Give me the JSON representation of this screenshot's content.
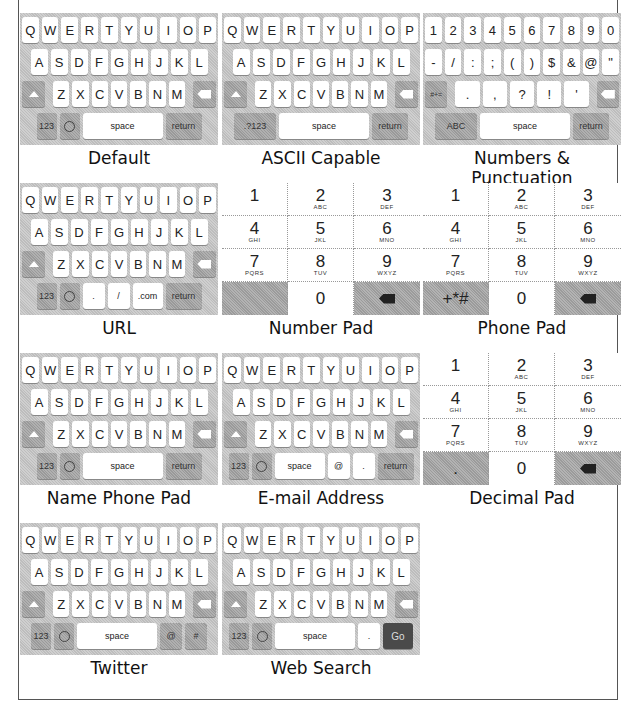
{
  "keyboards": [
    {
      "name": "Default",
      "rows": [
        [
          "Q",
          "W",
          "E",
          "R",
          "T",
          "Y",
          "U",
          "I",
          "O",
          "P"
        ],
        [
          "A",
          "S",
          "D",
          "F",
          "G",
          "H",
          "J",
          "K",
          "L"
        ],
        [
          "Z",
          "X",
          "C",
          "V",
          "B",
          "N",
          "M"
        ]
      ],
      "bottom": [
        "123",
        "emoji",
        "space",
        "return"
      ]
    },
    {
      "name": "ASCII Capable",
      "rows": [
        [
          "Q",
          "W",
          "E",
          "R",
          "T",
          "Y",
          "U",
          "I",
          "O",
          "P"
        ],
        [
          "A",
          "S",
          "D",
          "F",
          "G",
          "H",
          "J",
          "K",
          "L"
        ],
        [
          "Z",
          "X",
          "C",
          "V",
          "B",
          "N",
          "M"
        ]
      ],
      "bottom": [
        ".?123",
        "space",
        "return"
      ]
    },
    {
      "name": "Numbers & Punctuation",
      "rows": [
        [
          "1",
          "2",
          "3",
          "4",
          "5",
          "6",
          "7",
          "8",
          "9",
          "0"
        ],
        [
          "-",
          "/",
          ":",
          ";",
          "(",
          ")",
          "$",
          "&",
          "@",
          "\""
        ],
        [
          ".",
          ",",
          "?",
          "!",
          "'"
        ]
      ],
      "bottom": [
        "ABC",
        "space",
        "return"
      ],
      "left_mod": "#+="
    },
    {
      "name": "URL",
      "rows": [
        [
          "Q",
          "W",
          "E",
          "R",
          "T",
          "Y",
          "U",
          "I",
          "O",
          "P"
        ],
        [
          "A",
          "S",
          "D",
          "F",
          "G",
          "H",
          "J",
          "K",
          "L"
        ],
        [
          "Z",
          "X",
          "C",
          "V",
          "B",
          "N",
          "M"
        ]
      ],
      "bottom": [
        "123",
        "emoji",
        ".",
        "/",
        ".com",
        "return"
      ]
    },
    {
      "name": "Number Pad",
      "keys": [
        [
          "1",
          ""
        ],
        [
          "2",
          "ABC"
        ],
        [
          "3",
          "DEF"
        ],
        [
          "4",
          "GHI"
        ],
        [
          "5",
          "JKL"
        ],
        [
          "6",
          "MNO"
        ],
        [
          "7",
          "PQRS"
        ],
        [
          "8",
          "TUV"
        ],
        [
          "9",
          "WXYZ"
        ],
        [
          "",
          ""
        ],
        [
          "0",
          ""
        ],
        [
          "delete",
          ""
        ]
      ]
    },
    {
      "name": "Phone Pad",
      "keys": [
        [
          "1",
          ""
        ],
        [
          "2",
          "ABC"
        ],
        [
          "3",
          "DEF"
        ],
        [
          "4",
          "GHI"
        ],
        [
          "5",
          "JKL"
        ],
        [
          "6",
          "MNO"
        ],
        [
          "7",
          "PQRS"
        ],
        [
          "8",
          "TUV"
        ],
        [
          "9",
          "WXYZ"
        ],
        [
          "+*#",
          ""
        ],
        [
          "0",
          ""
        ],
        [
          "delete",
          ""
        ]
      ]
    },
    {
      "name": "Name Phone Pad",
      "rows": [
        [
          "Q",
          "W",
          "E",
          "R",
          "T",
          "Y",
          "U",
          "I",
          "O",
          "P"
        ],
        [
          "A",
          "S",
          "D",
          "F",
          "G",
          "H",
          "J",
          "K",
          "L"
        ],
        [
          "Z",
          "X",
          "C",
          "V",
          "B",
          "N",
          "M"
        ]
      ],
      "bottom": [
        "123",
        "emoji",
        "space",
        "return"
      ]
    },
    {
      "name": "E-mail Address",
      "rows": [
        [
          "Q",
          "W",
          "E",
          "R",
          "T",
          "Y",
          "U",
          "I",
          "O",
          "P"
        ],
        [
          "A",
          "S",
          "D",
          "F",
          "G",
          "H",
          "J",
          "K",
          "L"
        ],
        [
          "Z",
          "X",
          "C",
          "V",
          "B",
          "N",
          "M"
        ]
      ],
      "bottom": [
        "123",
        "emoji",
        "space",
        "@",
        ".",
        "return"
      ]
    },
    {
      "name": "Decimal Pad",
      "keys": [
        [
          "1",
          ""
        ],
        [
          "2",
          "ABC"
        ],
        [
          "3",
          "DEF"
        ],
        [
          "4",
          "GHI"
        ],
        [
          "5",
          "JKL"
        ],
        [
          "6",
          "MNO"
        ],
        [
          "7",
          "PQRS"
        ],
        [
          "8",
          "TUV"
        ],
        [
          "9",
          "WXYZ"
        ],
        [
          ".",
          ""
        ],
        [
          "0",
          ""
        ],
        [
          "delete",
          ""
        ]
      ]
    },
    {
      "name": "Twitter",
      "rows": [
        [
          "Q",
          "W",
          "E",
          "R",
          "T",
          "Y",
          "U",
          "I",
          "O",
          "P"
        ],
        [
          "A",
          "S",
          "D",
          "F",
          "G",
          "H",
          "J",
          "K",
          "L"
        ],
        [
          "Z",
          "X",
          "C",
          "V",
          "B",
          "N",
          "M"
        ]
      ],
      "bottom": [
        "123",
        "emoji",
        "space",
        "@",
        "#"
      ]
    },
    {
      "name": "Web Search",
      "rows": [
        [
          "Q",
          "W",
          "E",
          "R",
          "T",
          "Y",
          "U",
          "I",
          "O",
          "P"
        ],
        [
          "A",
          "S",
          "D",
          "F",
          "G",
          "H",
          "J",
          "K",
          "L"
        ],
        [
          "Z",
          "X",
          "C",
          "V",
          "B",
          "N",
          "M"
        ]
      ],
      "bottom": [
        "123",
        "emoji",
        "space",
        ".",
        "Go"
      ]
    }
  ]
}
